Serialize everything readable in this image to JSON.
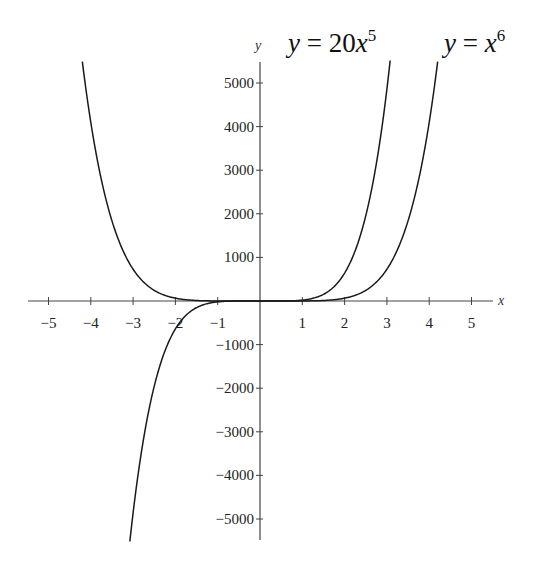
{
  "chart_data": {
    "type": "line",
    "title": "",
    "xlabel": "x",
    "ylabel": "y",
    "xlim": [
      -5.5,
      5.5
    ],
    "ylim": [
      -5500,
      5500
    ],
    "grid": false,
    "x_ticks": [
      -5,
      -4,
      -3,
      -2,
      -1,
      1,
      2,
      3,
      4,
      5
    ],
    "x_tick_labels": [
      "−5",
      "−4",
      "−3",
      "−2",
      "−1",
      "1",
      "2",
      "3",
      "4",
      "5"
    ],
    "y_ticks": [
      5000,
      4000,
      3000,
      2000,
      1000,
      -1000,
      -2000,
      -3000,
      -4000,
      -5000
    ],
    "y_tick_labels": [
      "5000",
      "4000",
      "3000",
      "2000",
      "1000",
      "−1000",
      "−2000",
      "−3000",
      "−4000",
      "−5000"
    ],
    "series": [
      {
        "name": "y = 20x^5",
        "label_text": {
          "lhs": "y",
          "eq": " = 20",
          "var": "x",
          "exp": "5"
        },
        "coefficient": 20,
        "exponent": 5,
        "domain": [
          -3.077,
          3.077
        ],
        "x": [
          -3,
          -2.5,
          -2,
          -1.5,
          -1,
          0,
          1,
          1.5,
          2,
          2.5,
          3
        ],
        "values": [
          -4860,
          -1953,
          -640,
          -152,
          -20,
          0,
          20,
          152,
          640,
          1953,
          4860
        ],
        "color": "#1a1a1a"
      },
      {
        "name": "y = x^6",
        "label_text": {
          "lhs": "y",
          "eq": " = ",
          "var": "x",
          "exp": "6"
        },
        "coefficient": 1,
        "exponent": 6,
        "domain": [
          -4.2,
          4.2
        ],
        "x": [
          -4,
          -3.5,
          -3,
          -2.5,
          -2,
          -1.5,
          -1,
          0,
          1,
          1.5,
          2,
          2.5,
          3,
          3.5,
          4
        ],
        "values": [
          4096,
          1838,
          729,
          244,
          64,
          11,
          1,
          0,
          1,
          11,
          64,
          244,
          729,
          1838,
          4096
        ],
        "color": "#1a1a1a"
      }
    ]
  }
}
